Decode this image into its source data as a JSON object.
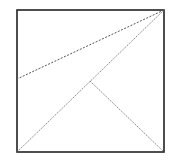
{
  "diagram": {
    "type": "geometric-square-with-lines",
    "square": {
      "x": 17,
      "y": 10,
      "width": 147,
      "height": 142,
      "stroke": "#222222"
    },
    "points": {
      "top_right": [
        164,
        10
      ],
      "bottom_left": [
        17,
        152
      ],
      "bottom_right": [
        164,
        152
      ],
      "left_mid": [
        17,
        79
      ],
      "interior": [
        90,
        81
      ]
    },
    "lines": [
      {
        "name": "top-right-to-left-edge",
        "from": "top_right",
        "to": "left_mid",
        "style": "dashed"
      },
      {
        "name": "top-right-to-bottom-left",
        "from": "top_right",
        "to": "bottom_left",
        "style": "dotted"
      },
      {
        "name": "interior-to-bottom-right",
        "from": "interior",
        "to": "bottom_right",
        "style": "dotted"
      }
    ],
    "line_color": "#555555"
  }
}
